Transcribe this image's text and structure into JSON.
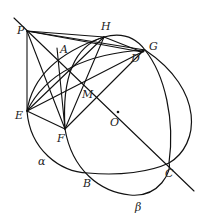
{
  "diagram": {
    "type": "geometry",
    "points": {
      "P": {
        "label": "P",
        "x": 27,
        "y": 31
      },
      "H": {
        "label": "H",
        "x": 104,
        "y": 37
      },
      "G": {
        "label": "G",
        "x": 145,
        "y": 50
      },
      "D": {
        "label": "D",
        "x": 142,
        "y": 52
      },
      "A": {
        "label": "A",
        "x": 66,
        "y": 64
      },
      "M": {
        "label": "M",
        "x": 86,
        "y": 89
      },
      "E": {
        "label": "E",
        "x": 27,
        "y": 111
      },
      "F": {
        "label": "F",
        "x": 65,
        "y": 129
      },
      "O": {
        "label": "O",
        "x": 118,
        "y": 112
      },
      "B": {
        "label": "B",
        "x": 88,
        "y": 173
      },
      "C": {
        "label": "C",
        "x": 169,
        "y": 163
      }
    },
    "region_labels": {
      "alpha": "α",
      "beta": "β"
    },
    "segments": [
      [
        "P",
        "G"
      ],
      [
        "P",
        "H"
      ],
      [
        "P",
        "E"
      ],
      [
        "P",
        "F"
      ],
      [
        "P",
        "C"
      ],
      [
        "E",
        "H"
      ],
      [
        "E",
        "D"
      ],
      [
        "E",
        "F"
      ],
      [
        "E",
        "M"
      ],
      [
        "F",
        "H"
      ],
      [
        "F",
        "D"
      ],
      [
        "F",
        "A"
      ],
      [
        "H",
        "D"
      ],
      [
        "A",
        "D"
      ]
    ]
  }
}
